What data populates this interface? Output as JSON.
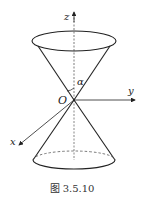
{
  "figure": {
    "type": "double-cone-diagram",
    "caption": "图 3.5.10",
    "axes": {
      "z_label": "z",
      "y_label": "y",
      "x_label": "x",
      "origin_label": "O"
    },
    "angle_label": "α",
    "colors": {
      "stroke": "#222222",
      "axis": "#333333",
      "dashed": "#555555"
    }
  }
}
